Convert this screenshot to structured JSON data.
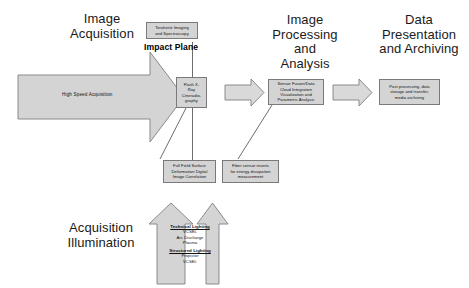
{
  "diagram": {
    "type": "flow-diagram",
    "colors": {
      "shape_fill": "#d4d4d4",
      "shape_stroke": "#8a8a8a",
      "line": "#6d6d6d",
      "text": "#111111",
      "background": "#ffffff"
    }
  },
  "headings": {
    "image_acquisition": "Image\nAcquisition",
    "image_processing": "Image\nProcessing\nand\nAnalysis",
    "data_presentation": "Data\nPresentation\nand Archiving",
    "acquisition_illumination": "Acquisition\nIllumination"
  },
  "labels": {
    "impact_plane": "Impact Plane",
    "high_speed_acquisition": "High Speed Acquisition"
  },
  "boxes": {
    "terahertz": "Terahertz Imaging\nand Spectroscopy",
    "flash_xray": "Flash X-\nRay\nCineradio-\ngraphy",
    "sensor_fusion": "Sensor Fusion/Data\nCloud Integration\nVisualization and\nParametric Analysis",
    "post_processing": "Post processing, data\nstorage and transfer,\nmedia archiving",
    "full_field": "Full Field Surface\nDeformation Digital\nImage Correlation",
    "fiber_sensor": "Fiber sensor inserts\nfor energy dissipation\nmeasurement"
  },
  "illumination": {
    "technical_heading": "Technical Lighting",
    "technical_items": "VCSEL\nArc Discharge\nPlasma",
    "structured_heading": "Structured Lighting",
    "structured_items": "Projector\nVCSEL"
  },
  "arrows": {
    "big_right_arrow": "high-speed-acquisition-arrow",
    "stage_arrow_1": "acquisition-to-processing-arrow",
    "stage_arrow_2": "processing-to-presentation-arrow",
    "illum_arrow_left": "illumination-arrow-left",
    "illum_arrow_right": "illumination-arrow-right"
  }
}
